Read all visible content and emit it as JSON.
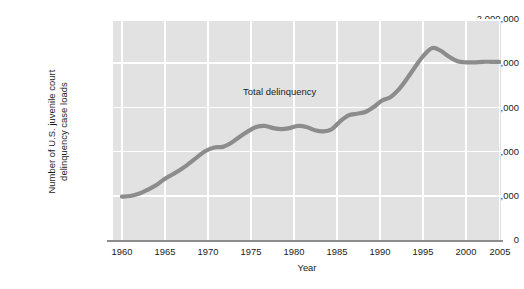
{
  "chart_data": {
    "type": "line",
    "title": "",
    "subtitle": "",
    "xlabel": "Year",
    "ylabel": "Number of U.S. juvenile court\ndelinquency case loads",
    "xlim": [
      1960,
      2005
    ],
    "ylim": [
      0,
      2000000
    ],
    "grid": true,
    "legend_position": "inline-annotation",
    "annotations": [
      {
        "text": "Total delinquency",
        "x": 1978,
        "y": 1290000
      }
    ],
    "x_ticks": [
      1960,
      1965,
      1970,
      1975,
      1980,
      1985,
      1990,
      1995,
      2000,
      2005
    ],
    "x_tick_labels": [
      "1960",
      "1965",
      "1970",
      "1975",
      "1980",
      "1985",
      "1990",
      "1995",
      "2000",
      "2005"
    ],
    "y_ticks": [
      0,
      400000,
      800000,
      1200000,
      1600000,
      2000000
    ],
    "y_tick_labels": [
      "0",
      "400,000",
      "800,000",
      "1,200,000",
      "1,600,000",
      "2,000,000"
    ],
    "series": [
      {
        "name": "Total delinquency",
        "color": "#8c8c8c",
        "x": [
          1960,
          1961,
          1962,
          1963,
          1964,
          1965,
          1966,
          1967,
          1968,
          1969,
          1970,
          1971,
          1972,
          1973,
          1974,
          1975,
          1976,
          1977,
          1978,
          1979,
          1980,
          1981,
          1982,
          1983,
          1984,
          1985,
          1986,
          1987,
          1988,
          1989,
          1990,
          1991,
          1992,
          1993,
          1994,
          1995,
          1996,
          1997,
          1998,
          1999,
          2000,
          2001,
          2002,
          2003,
          2004,
          2005
        ],
        "values": [
          400000,
          405000,
          425000,
          460000,
          500000,
          555000,
          600000,
          645000,
          700000,
          760000,
          815000,
          845000,
          850000,
          885000,
          940000,
          990000,
          1030000,
          1040000,
          1020000,
          1010000,
          1020000,
          1040000,
          1030000,
          1000000,
          990000,
          1010000,
          1080000,
          1135000,
          1150000,
          1165000,
          1210000,
          1270000,
          1300000,
          1370000,
          1470000,
          1580000,
          1680000,
          1745000,
          1720000,
          1665000,
          1625000,
          1615000,
          1615000,
          1620000,
          1620000,
          1620000
        ]
      }
    ]
  },
  "axis": {
    "y_title": "Number of U.S. juvenile court\ndelinquency case loads",
    "x_title": "Year"
  },
  "style": {
    "plot_background": "#e2e2e2",
    "gridline_color": "#ffffff",
    "series_color": "#8c8c8c",
    "axis_line_color": "#8d8d8d",
    "text_color": "#1b1b1b"
  }
}
